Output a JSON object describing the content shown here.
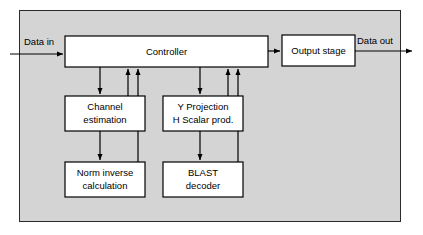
{
  "diagram": {
    "colors": {
      "frame_fill": "#d4d4d4",
      "frame_stroke": "#2b2b2b",
      "block_fill": "#ffffff",
      "block_stroke": "#000000",
      "line": "#000000",
      "text": "#000000",
      "page_background": "#ffffff"
    },
    "frame": {
      "name": "outer-enclosure"
    },
    "blocks": [
      {
        "id": "controller",
        "lines": [
          "Controller"
        ],
        "x": 65,
        "y": 36,
        "w": 203,
        "h": 31
      },
      {
        "id": "output-stage",
        "lines": [
          "Output stage"
        ],
        "x": 282,
        "y": 35,
        "w": 73,
        "h": 31
      },
      {
        "id": "channel-estimation",
        "lines": [
          "Channel",
          "estimation"
        ],
        "x": 65,
        "y": 96,
        "w": 80,
        "h": 35
      },
      {
        "id": "y-projection",
        "lines": [
          "Y Projection",
          "H Scalar prod."
        ],
        "x": 163,
        "y": 96,
        "w": 80,
        "h": 35
      },
      {
        "id": "norm-inverse",
        "lines": [
          "Norm inverse",
          "calculation"
        ],
        "x": 65,
        "y": 162,
        "w": 80,
        "h": 35
      },
      {
        "id": "blast-decoder",
        "lines": [
          "BLAST",
          "decoder"
        ],
        "x": 163,
        "y": 162,
        "w": 80,
        "h": 35
      }
    ],
    "labels": {
      "data_in": "Data in",
      "data_out": "Data out"
    },
    "signals": [
      {
        "id": "data-in-to-controller",
        "from": "Data in",
        "to": "Controller"
      },
      {
        "id": "controller-to-output-stage",
        "from": "Controller",
        "to": "Output stage"
      },
      {
        "id": "output-stage-to-data-out",
        "from": "Output stage",
        "to": "Data out"
      },
      {
        "id": "controller-to-channel-estimation",
        "from": "Controller",
        "to": "Channel estimation"
      },
      {
        "id": "controller-to-y-projection",
        "from": "Controller",
        "to": "Y Projection / H Scalar prod."
      },
      {
        "id": "channel-estimation-to-norm-inverse",
        "from": "Channel estimation",
        "to": "Norm inverse calculation"
      },
      {
        "id": "y-projection-to-blast-decoder",
        "from": "Y Projection / H Scalar prod.",
        "to": "BLAST decoder"
      },
      {
        "id": "channel-estimation-to-controller",
        "from": "Channel estimation",
        "to": "Controller"
      },
      {
        "id": "norm-inverse-to-controller",
        "from": "Norm inverse calculation",
        "to": "Controller"
      },
      {
        "id": "y-projection-to-controller",
        "from": "Y Projection / H Scalar prod.",
        "to": "Controller"
      },
      {
        "id": "blast-decoder-to-controller",
        "from": "BLAST decoder",
        "to": "Controller"
      }
    ]
  }
}
